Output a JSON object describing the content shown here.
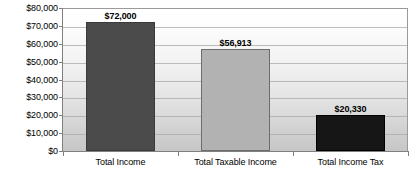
{
  "chart_data": {
    "type": "bar",
    "title": "",
    "subtitle": "",
    "xlabel": "",
    "ylabel": "",
    "categories": [
      "Total Income",
      "Total Taxable Income",
      "Total Income Tax"
    ],
    "values": [
      72000,
      56913,
      20330
    ],
    "data_labels": [
      "$72,000",
      "$56,913",
      "$20,330"
    ],
    "ylim": [
      0,
      80000
    ],
    "ytick_values": [
      0,
      10000,
      20000,
      30000,
      40000,
      50000,
      60000,
      70000,
      80000
    ],
    "ytick_labels": [
      "$0",
      "$10,000",
      "$20,000",
      "$30,000",
      "$40,000",
      "$50,000",
      "$60,000",
      "$70,000",
      "$80,000"
    ],
    "grid": true,
    "grid_axis": "y",
    "legend": false,
    "legend_position": "none",
    "bar_colors": [
      "#4b4b4b",
      "#b2b2b2",
      "#161616"
    ],
    "plot_background": "vertical-gradient-white-to-gray",
    "axis_color": "#808080"
  }
}
